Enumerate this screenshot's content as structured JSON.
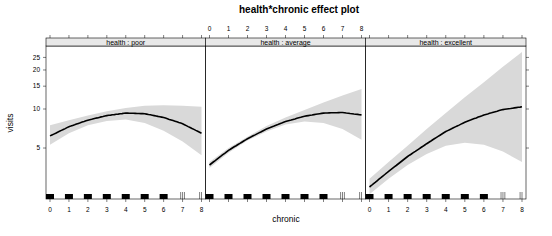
{
  "chart_data": {
    "type": "line",
    "title": "health*chronic effect plot",
    "xlabel": "chronic",
    "ylabel": "visits",
    "y_scale": "log",
    "ylim": [
      2.02,
      30.6
    ],
    "xlim": [
      -0.2,
      8.2
    ],
    "y_ticks": [
      5,
      10,
      15,
      20,
      25
    ],
    "x_ticks": [
      0,
      1,
      2,
      3,
      4,
      5,
      6,
      7,
      8
    ],
    "grid": false,
    "legend": "none",
    "band_color": "#d9d9d9",
    "line_color": "#000000",
    "strip_color": "#e8e8e8",
    "x": [
      0,
      1,
      2,
      3,
      4,
      5,
      6,
      7,
      8
    ],
    "panels": [
      {
        "name": "health : poor",
        "fit": [
          6.2,
          7.3,
          8.2,
          8.9,
          9.3,
          9.2,
          8.6,
          7.7,
          6.5
        ],
        "lower": [
          5.3,
          6.5,
          7.5,
          8.1,
          8.3,
          7.8,
          6.8,
          5.6,
          4.4
        ],
        "upper": [
          7.5,
          8.2,
          8.9,
          9.6,
          10.2,
          10.6,
          10.7,
          10.6,
          10.4
        ]
      },
      {
        "name": "health : average",
        "fit": [
          3.7,
          4.8,
          5.9,
          7.0,
          8.0,
          8.8,
          9.3,
          9.4,
          9.0
        ],
        "lower": [
          3.5,
          4.6,
          5.7,
          6.7,
          7.6,
          8.0,
          7.8,
          7.0,
          5.8
        ],
        "upper": [
          3.9,
          5.0,
          6.1,
          7.4,
          8.6,
          9.8,
          11.2,
          12.7,
          14.3
        ]
      },
      {
        "name": "health : excellent",
        "fit": [
          2.5,
          3.3,
          4.3,
          5.4,
          6.7,
          7.9,
          9.0,
          9.9,
          10.4
        ],
        "lower": [
          2.2,
          2.9,
          3.7,
          4.5,
          5.2,
          5.5,
          5.3,
          4.7,
          3.9
        ],
        "upper": [
          2.9,
          3.9,
          5.2,
          7.0,
          9.3,
          12.3,
          16.1,
          21.2,
          27.5
        ]
      }
    ],
    "rug": {
      "blocks": [
        0,
        1,
        2,
        3,
        4,
        5,
        6
      ],
      "ticks": [
        6.9,
        7.0,
        7.1,
        7.9,
        8.0
      ]
    }
  }
}
